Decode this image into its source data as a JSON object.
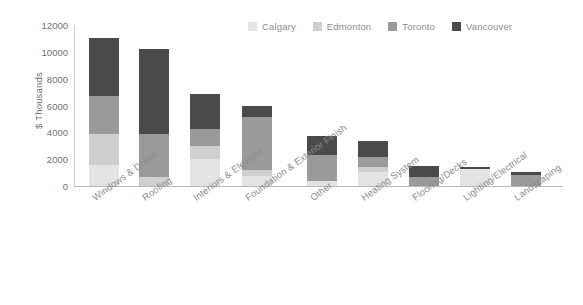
{
  "chart_data": {
    "type": "bar",
    "stacked": true,
    "title": "",
    "xlabel": "",
    "ylabel": "$ Thousands",
    "ylim": [
      0,
      12000
    ],
    "ytick_labels": [
      "12000",
      "10000",
      "8000",
      "6000",
      "4000",
      "2000",
      "0"
    ],
    "yticks": [
      12000,
      10000,
      8000,
      6000,
      4000,
      2000,
      0
    ],
    "grid": false,
    "legend_position": "top-right",
    "categories": [
      "Windows & Doors",
      "Roofing",
      "Interiors & Elevator",
      "Foundation & Exterior Finish",
      "Other",
      "Heating System",
      "Flooring/Decks",
      "Lighting/Electrical",
      "Landscaping"
    ],
    "series": [
      {
        "name": "Calgary",
        "color": "#e3e3e3",
        "values": [
          1570,
          0,
          2030,
          760,
          390,
          1060,
          0,
          1280,
          0
        ]
      },
      {
        "name": "Edmonton",
        "color": "#cfcfcf",
        "values": [
          2300,
          670,
          960,
          450,
          0,
          330,
          0,
          0,
          0
        ]
      },
      {
        "name": "Toronto",
        "color": "#9a9a9a",
        "values": [
          2830,
          3200,
          1250,
          3900,
          1920,
          810,
          690,
          0,
          800
        ]
      },
      {
        "name": "Vancouver",
        "color": "#4a4a4a",
        "values": [
          4300,
          6380,
          2610,
          890,
          1420,
          1150,
          820,
          120,
          280
        ]
      }
    ],
    "totals": [
      11000,
      10250,
      6850,
      6000,
      3730,
      3350,
      1510,
      1400,
      1080
    ]
  },
  "legend": {
    "items": [
      {
        "label": "Calgary",
        "color": "#e3e3e3"
      },
      {
        "label": "Edmonton",
        "color": "#cfcfcf"
      },
      {
        "label": "Toronto",
        "color": "#9a9a9a"
      },
      {
        "label": "Vancouver",
        "color": "#4a4a4a"
      }
    ]
  },
  "axes": {
    "y_title": "$ Thousands"
  }
}
